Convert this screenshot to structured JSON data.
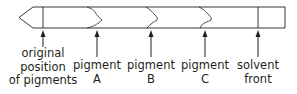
{
  "diagram": {
    "colors": {
      "stroke": "#231f20",
      "background": "#ffffff"
    },
    "labels": {
      "origin": [
        "original",
        "position",
        "of pigments"
      ],
      "pigment_a": [
        "pigment",
        "A"
      ],
      "pigment_b": [
        "pigment",
        "B"
      ],
      "pigment_c": [
        "pigment",
        "C"
      ],
      "solvent_front": [
        "solvent",
        "front"
      ]
    }
  }
}
